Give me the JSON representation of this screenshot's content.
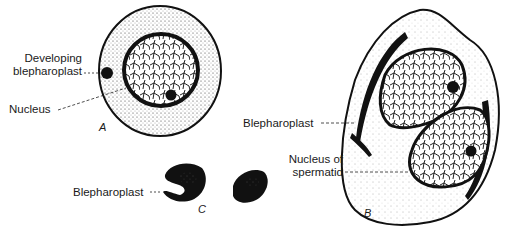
{
  "figure": {
    "panels": [
      {
        "id": "A",
        "letter": "A",
        "description": "Cell with developing blepharoplast and nucleus"
      },
      {
        "id": "B",
        "letter": "B",
        "description": "Cell with two spermatid nuclei and blepharoplasts"
      },
      {
        "id": "C",
        "letter": "C",
        "description": "Blepharoplast forms"
      }
    ],
    "labels": {
      "developing_line1": "Developing",
      "developing_line2": "blepharoplast",
      "nucleus": "Nucleus",
      "blepharoplast_b": "Blepharoplast",
      "nucleus_of_line1": "Nucleus of",
      "nucleus_of_line2": "spermatid",
      "blepharoplast_c": "Blepharoplast"
    },
    "colors": {
      "ink": "#1a1a1a",
      "background": "#ffffff"
    }
  }
}
